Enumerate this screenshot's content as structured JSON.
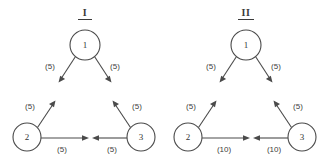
{
  "figure": {
    "background_color": "#ffffff",
    "stroke_color": "#4a4a4a",
    "text_color": "#3a3a3a",
    "width": 322,
    "height": 162
  },
  "panels": [
    {
      "id": "panel-i",
      "title": "I",
      "title_underlined": true,
      "nodes": [
        {
          "id": "n1",
          "label": "1",
          "cx": 85,
          "cy": 45,
          "r": 15
        },
        {
          "id": "n2",
          "label": "2",
          "cx": 27,
          "cy": 137,
          "r": 14
        },
        {
          "id": "n3",
          "label": "3",
          "cx": 141,
          "cy": 137,
          "r": 14
        }
      ],
      "edges": [
        {
          "id": "e1-down-left",
          "from": "1",
          "to": "",
          "label": "(5)",
          "lx": 50,
          "ly": 67
        },
        {
          "id": "e1-down-right",
          "from": "1",
          "to": "",
          "label": "(5)",
          "lx": 115,
          "ly": 67
        },
        {
          "id": "e2-up-right",
          "from": "2",
          "to": "",
          "label": "(5)",
          "lx": 30,
          "ly": 107
        },
        {
          "id": "e2-right",
          "from": "2",
          "to": "",
          "label": "(5)",
          "lx": 62,
          "ly": 150
        },
        {
          "id": "e3-up-left",
          "from": "3",
          "to": "",
          "label": "(5)",
          "lx": 137,
          "ly": 107
        },
        {
          "id": "e3-left",
          "from": "3",
          "to": "",
          "label": "(5)",
          "lx": 112,
          "ly": 150
        }
      ]
    },
    {
      "id": "panel-ii",
      "title": "II",
      "title_underlined": true,
      "nodes": [
        {
          "id": "n1",
          "label": "1",
          "cx": 246,
          "cy": 45,
          "r": 15
        },
        {
          "id": "n2",
          "label": "2",
          "cx": 188,
          "cy": 137,
          "r": 14
        },
        {
          "id": "n3",
          "label": "3",
          "cx": 302,
          "cy": 137,
          "r": 14
        }
      ],
      "edges": [
        {
          "id": "e1-down-left",
          "from": "1",
          "to": "",
          "label": "(5)",
          "lx": 211,
          "ly": 67
        },
        {
          "id": "e1-down-right",
          "from": "1",
          "to": "",
          "label": "(5)",
          "lx": 276,
          "ly": 67
        },
        {
          "id": "e2-up-right",
          "from": "2",
          "to": "",
          "label": "(5)",
          "lx": 191,
          "ly": 107
        },
        {
          "id": "e2-right",
          "from": "2",
          "to": "",
          "label": "(10)",
          "lx": 224,
          "ly": 150
        },
        {
          "id": "e3-up-left",
          "from": "3",
          "to": "",
          "label": "(5)",
          "lx": 298,
          "ly": 107
        },
        {
          "id": "e3-left",
          "from": "3",
          "to": "",
          "label": "(10)",
          "lx": 274,
          "ly": 150
        }
      ]
    }
  ]
}
